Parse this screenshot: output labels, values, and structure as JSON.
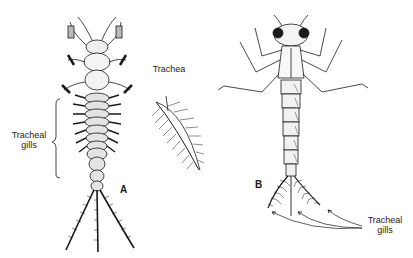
{
  "figure": {
    "panels": [
      {
        "id": "A",
        "letter": "A",
        "subject": "mayfly-nymph",
        "labels": {
          "tracheal_gills_line1": "Tracheal",
          "tracheal_gills_line2": "gills",
          "trachea": "Trachea"
        }
      },
      {
        "id": "B",
        "letter": "B",
        "subject": "damselfly-nymph",
        "labels": {
          "tracheal_gills_line1": "Tracheal",
          "tracheal_gills_line2": "gills"
        }
      }
    ],
    "colors": {
      "ink": "#1a1a1a",
      "background": "#ffffff"
    }
  }
}
